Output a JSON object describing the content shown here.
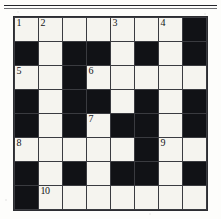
{
  "page": {
    "kind": "crossword-puzzle-grid",
    "rule_above_grid": true
  },
  "chart_data": {
    "type": "table",
    "title": "",
    "rows": 8,
    "columns": 8,
    "legend": "1 = white/open cell, 0 = black/blocked cell",
    "cells": [
      [
        1,
        1,
        1,
        1,
        1,
        1,
        1,
        0
      ],
      [
        0,
        1,
        0,
        0,
        1,
        0,
        1,
        0
      ],
      [
        1,
        1,
        0,
        1,
        1,
        1,
        1,
        1
      ],
      [
        0,
        1,
        0,
        0,
        1,
        0,
        1,
        0
      ],
      [
        0,
        1,
        0,
        1,
        0,
        0,
        1,
        0
      ],
      [
        1,
        1,
        1,
        1,
        1,
        0,
        1,
        1
      ],
      [
        0,
        1,
        0,
        1,
        0,
        0,
        1,
        0
      ],
      [
        0,
        1,
        1,
        1,
        1,
        1,
        1,
        1
      ]
    ],
    "numbers": [
      {
        "label": "1",
        "row": 1,
        "col": 1
      },
      {
        "label": "2",
        "row": 1,
        "col": 2
      },
      {
        "label": "3",
        "row": 1,
        "col": 5
      },
      {
        "label": "4",
        "row": 1,
        "col": 7
      },
      {
        "label": "5",
        "row": 3,
        "col": 1
      },
      {
        "label": "6",
        "row": 3,
        "col": 4
      },
      {
        "label": "7",
        "row": 5,
        "col": 4
      },
      {
        "label": "8",
        "row": 6,
        "col": 1
      },
      {
        "label": "9",
        "row": 6,
        "col": 7
      },
      {
        "label": "10",
        "row": 8,
        "col": 2
      }
    ]
  },
  "colors": {
    "paper": "#fdfdfb",
    "open_cell": "#f5f4ef",
    "blocked_cell": "#111216",
    "grid_line": "#3a3b40",
    "number_text": "#131418",
    "rule": "#24252a"
  }
}
